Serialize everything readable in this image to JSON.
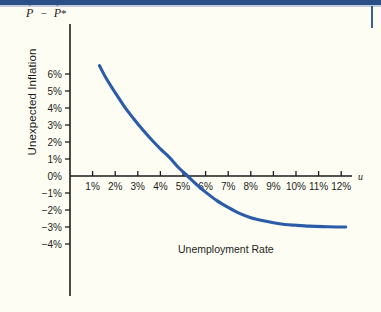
{
  "figure": {
    "background_color": "#fefdf3",
    "band_color": "#2a4f86",
    "curve_color": "#2a5ca8",
    "axis_color": "#1d1d1d"
  },
  "labels": {
    "y_axis_caption_var": "P",
    "y_axis_caption_dot": "·",
    "y_axis_caption_operator": "−",
    "y_axis_caption_star": "*",
    "y_axis_title": "Unexpected Inflation",
    "x_axis_title": "Unemployment Rate",
    "x_axis_variable": "u"
  },
  "chart_data": {
    "type": "line",
    "title": "",
    "xlabel": "Unemployment Rate",
    "ylabel": "Unexpected Inflation",
    "y_axis_caption": "Ṗ − Ṗ*",
    "x_variable": "u",
    "xlim": [
      0,
      12.9
    ],
    "ylim": [
      -4.6,
      6.9
    ],
    "grid": false,
    "legend": null,
    "x_tick_labels": [
      "1%",
      "2%",
      "3%",
      "4%",
      "5%",
      "6%",
      "7%",
      "8%",
      "9%",
      "10%",
      "11%",
      "12%"
    ],
    "x_tick_values": [
      1,
      2,
      3,
      4,
      5,
      6,
      7,
      8,
      9,
      10,
      11,
      12
    ],
    "y_tick_labels": [
      "6%",
      "5%",
      "4%",
      "3%",
      "2%",
      "1%",
      "0%",
      "−1%",
      "−2%",
      "−3%",
      "−4%"
    ],
    "y_tick_values": [
      6,
      5,
      4,
      3,
      2,
      1,
      0,
      -1,
      -2,
      -3,
      -4
    ],
    "series": [
      {
        "name": "Expectations-augmented Phillips curve",
        "color": "#2a5ca8",
        "x": [
          1.3,
          1.6,
          2.0,
          2.4,
          2.8,
          3.2,
          3.6,
          4.0,
          4.4,
          4.8,
          5.2,
          5.6,
          6.0,
          6.5,
          7.0,
          7.5,
          8.0,
          8.5,
          9.0,
          9.5,
          10.0,
          10.6,
          11.2,
          11.8,
          12.2
        ],
        "y": [
          6.5,
          5.75,
          4.9,
          4.1,
          3.4,
          2.75,
          2.15,
          1.6,
          1.1,
          0.5,
          0.0,
          -0.5,
          -0.95,
          -1.45,
          -1.85,
          -2.2,
          -2.45,
          -2.62,
          -2.75,
          -2.85,
          -2.9,
          -2.95,
          -2.98,
          -3.0,
          -3.0
        ]
      }
    ],
    "annotations": [
      {
        "text": "natural rate crossing",
        "x": 5.2,
        "y": 0.0
      }
    ]
  }
}
